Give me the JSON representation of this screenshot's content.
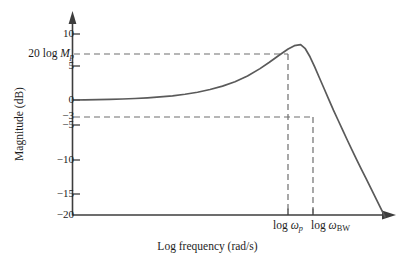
{
  "figure": {
    "background_color": "#ffffff",
    "curve_color": "#5a5a5a",
    "axis_color": "#3d3d3d",
    "dash_color": "#6e6e6e"
  },
  "axes": {
    "y_title": "Magnitude (dB)",
    "x_title": "Log frequency (rad/s)",
    "y_ticks": [
      {
        "value": 10,
        "label": "10"
      },
      {
        "value": 5,
        "label": "5"
      },
      {
        "value": 0,
        "label": "0"
      },
      {
        "value": -3,
        "label": "−3"
      },
      {
        "value": -5,
        "label": "−5"
      },
      {
        "value": -10,
        "label": "−10"
      },
      {
        "value": -15,
        "label": "−15"
      },
      {
        "value": -20,
        "label": "−20"
      }
    ],
    "y_special_tick": {
      "label_prefix": "20 log ",
      "label_symbol": "M",
      "label_subscript": "p",
      "value": 8.2
    },
    "x_ticks": [
      {
        "id": "wp",
        "prefix": "log ",
        "symbol": "ω",
        "subscript": "p",
        "subscript_italic": true
      },
      {
        "id": "wbw",
        "prefix": "log ",
        "symbol": "ω",
        "subscript": "BW",
        "subscript_italic": false
      }
    ],
    "ylim": [
      -20,
      12
    ],
    "xlim": [
      0,
      1
    ]
  },
  "chart_data": {
    "type": "line",
    "title": "",
    "subtitle": "",
    "xlabel": "Log frequency (rad/s)",
    "ylabel": "Magnitude (dB)",
    "ylim": [
      -20,
      12
    ],
    "grid": false,
    "legend": null,
    "series": [
      {
        "name": "Closed-loop magnitude response",
        "x": [
          0.0,
          0.04,
          0.08,
          0.12,
          0.16,
          0.2,
          0.24,
          0.28,
          0.32,
          0.36,
          0.4,
          0.44,
          0.48,
          0.52,
          0.56,
          0.6,
          0.63,
          0.66,
          0.69,
          0.71,
          0.73,
          0.745,
          0.76,
          0.775,
          0.79,
          0.805,
          0.82,
          0.835,
          0.85,
          0.865,
          0.88,
          0.895,
          0.91,
          0.925,
          0.94,
          0.955,
          0.97,
          0.985,
          1.0
        ],
        "y": [
          0.0,
          0.02,
          0.05,
          0.09,
          0.15,
          0.22,
          0.32,
          0.45,
          0.62,
          0.85,
          1.15,
          1.55,
          2.05,
          2.7,
          3.55,
          4.65,
          5.6,
          6.6,
          7.55,
          8.05,
          8.2,
          7.6,
          6.4,
          4.9,
          3.3,
          1.7,
          0.1,
          -1.5,
          -3.0,
          -4.5,
          -6.0,
          -7.45,
          -8.9,
          -10.3,
          -11.7,
          -13.1,
          -14.5,
          -15.9,
          -17.3
        ]
      }
    ],
    "annotations": [
      {
        "name": "peak-gain",
        "y_value": 8.2,
        "label": "20 log M_p",
        "style": "dashed-horizontal"
      },
      {
        "name": "minus-3db",
        "y_value": -3,
        "label": "−3",
        "style": "dashed-horizontal"
      },
      {
        "name": "resonant-frequency",
        "x_id": "wp",
        "label": "log ω_p",
        "style": "dashed-vertical"
      },
      {
        "name": "bandwidth-frequency",
        "x_id": "wbw",
        "label": "log ω_BW",
        "style": "dashed-vertical"
      }
    ]
  }
}
